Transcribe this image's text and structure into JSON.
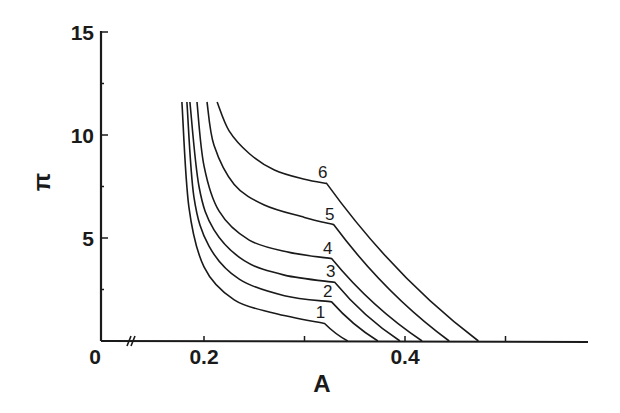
{
  "chart_data": {
    "type": "line",
    "title": "",
    "xlabel": "A",
    "ylabel": "π",
    "xlim": [
      0,
      0.58
    ],
    "ylim": [
      0,
      15
    ],
    "x_axis_break": true,
    "x_ticks": [
      0.2,
      0.3,
      0.4,
      0.5
    ],
    "x_tick_labels": [
      "0",
      "0.2",
      "0.4"
    ],
    "y_ticks": [
      2.5,
      5,
      7.5,
      10,
      12.5,
      15
    ],
    "y_tick_labels": [
      "0",
      "5",
      "10",
      "15"
    ],
    "grid": false,
    "legend": "inline numeric labels at curve kinks",
    "series": [
      {
        "name": "1",
        "points": [
          [
            0.178,
            11.6
          ],
          [
            0.185,
            6.5
          ],
          [
            0.2,
            3.6
          ],
          [
            0.23,
            2.0
          ],
          [
            0.27,
            1.35
          ],
          [
            0.32,
            0.85
          ],
          [
            0.343,
            0.0
          ]
        ]
      },
      {
        "name": "2",
        "points": [
          [
            0.183,
            11.6
          ],
          [
            0.19,
            7.0
          ],
          [
            0.205,
            4.6
          ],
          [
            0.235,
            3.0
          ],
          [
            0.28,
            2.2
          ],
          [
            0.327,
            1.9
          ],
          [
            0.373,
            0.0
          ]
        ]
      },
      {
        "name": "3",
        "points": [
          [
            0.186,
            11.6
          ],
          [
            0.195,
            7.5
          ],
          [
            0.21,
            5.4
          ],
          [
            0.24,
            3.9
          ],
          [
            0.28,
            3.2
          ],
          [
            0.33,
            2.85
          ],
          [
            0.395,
            0.0
          ]
        ]
      },
      {
        "name": "4",
        "points": [
          [
            0.193,
            11.6
          ],
          [
            0.2,
            8.5
          ],
          [
            0.215,
            6.3
          ],
          [
            0.245,
            4.9
          ],
          [
            0.285,
            4.3
          ],
          [
            0.327,
            4.0
          ],
          [
            0.417,
            0.0
          ]
        ]
      },
      {
        "name": "5",
        "points": [
          [
            0.203,
            11.6
          ],
          [
            0.21,
            9.5
          ],
          [
            0.23,
            7.6
          ],
          [
            0.26,
            6.6
          ],
          [
            0.3,
            6.0
          ],
          [
            0.329,
            5.65
          ],
          [
            0.444,
            0.0
          ]
        ]
      },
      {
        "name": "6",
        "points": [
          [
            0.213,
            11.6
          ],
          [
            0.225,
            10.2
          ],
          [
            0.245,
            9.1
          ],
          [
            0.27,
            8.3
          ],
          [
            0.3,
            7.85
          ],
          [
            0.322,
            7.65
          ],
          [
            0.473,
            0.0
          ]
        ]
      }
    ]
  }
}
